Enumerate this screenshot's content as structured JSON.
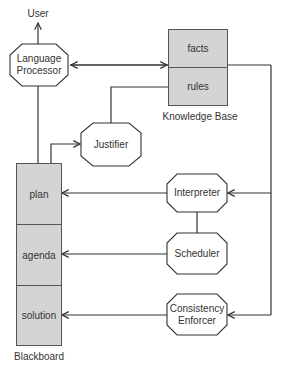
{
  "diagram": {
    "user_label": "User",
    "processes": {
      "language_processor": "Language\nProcessor",
      "justifier": "Justifier",
      "interpreter": "Interpreter",
      "scheduler": "Scheduler",
      "consistency_enforcer": "Consistency\nEnforcer"
    },
    "knowledge_base": {
      "title": "Knowledge Base",
      "sections": [
        "facts",
        "rules"
      ]
    },
    "blackboard": {
      "title": "Blackboard",
      "sections": [
        "plan",
        "agenda",
        "solution"
      ]
    },
    "colors": {
      "store_fill": "#d4d4d4",
      "line": "#333333"
    },
    "connections": [
      {
        "from": "Language Processor",
        "to": "User",
        "type": "arrow"
      },
      {
        "from": "Language Processor",
        "to": "Knowledge Base",
        "type": "bidirectional"
      },
      {
        "from": "rules",
        "to": "Justifier",
        "type": "line"
      },
      {
        "from": "Blackboard",
        "to": "Language Processor",
        "type": "line"
      },
      {
        "from": "Blackboard",
        "to": "Justifier",
        "type": "arrow"
      },
      {
        "from": "Interpreter",
        "to": "plan",
        "type": "arrow"
      },
      {
        "from": "Scheduler",
        "to": "agenda",
        "type": "arrow"
      },
      {
        "from": "Consistency Enforcer",
        "to": "solution",
        "type": "arrow"
      },
      {
        "from": "Knowledge Base",
        "to": "Interpreter",
        "type": "arrow"
      },
      {
        "from": "Knowledge Base",
        "to": "Consistency Enforcer",
        "type": "arrow"
      },
      {
        "from": "Interpreter",
        "to": "Scheduler",
        "type": "line"
      }
    ]
  }
}
